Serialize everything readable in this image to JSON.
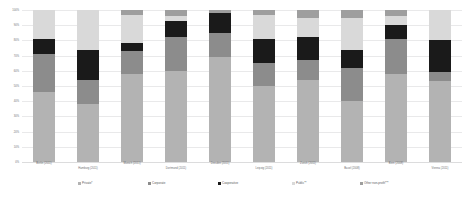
{
  "chart_data": {
    "type": "bar",
    "subtype": "100% stacked column",
    "title": "",
    "xlabel": "",
    "ylabel": "",
    "ylim": [
      0,
      100
    ],
    "grid": true,
    "legend_position": "bottom",
    "ytick_labels": [
      "100%",
      "90%",
      "80%",
      "70%",
      "60%",
      "50%",
      "40%",
      "30%",
      "20%",
      "10%",
      "0%"
    ],
    "ytick_values": [
      100,
      90,
      80,
      70,
      60,
      50,
      40,
      30,
      20,
      10,
      0
    ],
    "categories": [
      "Berlin (2011)",
      "Hamburg (2011)",
      "Munich (2011)",
      "Dortmund (2011)",
      "Dresden (2011)",
      "Leipzig (2011)",
      "Zurich (2011)",
      "Basel (2008)",
      "Bern (2008)",
      "Vienna (2011)"
    ],
    "series": [
      {
        "name": "Private*",
        "color": "#b3b3b3",
        "values": [
          46,
          38,
          58,
          60,
          69,
          50,
          54,
          40,
          58,
          53
        ]
      },
      {
        "name": "Corporate",
        "color": "#8c8c8c",
        "values": [
          25,
          16,
          15,
          22,
          16,
          15,
          13,
          22,
          23,
          6
        ]
      },
      {
        "name": "Cooperative",
        "color": "#1a1a1a",
        "values": [
          10,
          20,
          5,
          11,
          13,
          16,
          15,
          12,
          9,
          21
        ]
      },
      {
        "name": "Public**",
        "color": "#d9d9d9",
        "values": [
          19,
          26,
          19,
          3,
          0,
          16,
          13,
          21,
          6,
          20
        ]
      },
      {
        "name": "Other non-profit***",
        "color": "#9e9e9e",
        "values": [
          0,
          0,
          3,
          4,
          2,
          3,
          5,
          5,
          4,
          0
        ]
      }
    ]
  },
  "legend": {
    "items": [
      {
        "label": "Private*",
        "color": "#b3b3b3"
      },
      {
        "label": "Corporate",
        "color": "#8c8c8c"
      },
      {
        "label": "Cooperative",
        "color": "#1a1a1a"
      },
      {
        "label": "Public**",
        "color": "#d9d9d9"
      },
      {
        "label": "Other non-profit***",
        "color": "#9e9e9e"
      }
    ]
  }
}
